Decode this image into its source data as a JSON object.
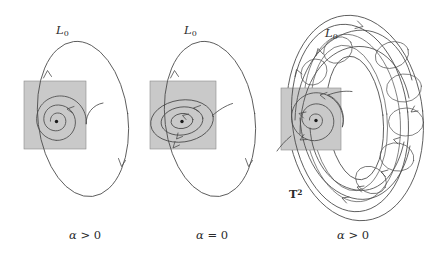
{
  "figure": {
    "background_color": "#ffffff",
    "curve_color": "#4a4a4a",
    "square_fill_color": "#c9c9c9",
    "square_stroke_color": "#8a8a8a",
    "equilibrium_color": "#1a1a1a"
  },
  "panels": [
    {
      "id": "panel-left",
      "caption": "α > 0",
      "caption_alpha": "α",
      "caption_relation": "> 0",
      "cycle_label": "L",
      "cycle_label_sub": "0",
      "description": "unstable focus with limit cycle",
      "orbit_type": "spiral-outward",
      "has_torus": false,
      "torus_label": "",
      "torus_label_sup": ""
    },
    {
      "id": "panel-middle",
      "caption": "α = 0",
      "caption_alpha": "α",
      "caption_relation": "= 0",
      "cycle_label": "L",
      "cycle_label_sub": "0",
      "description": "center with nested closed orbits",
      "orbit_type": "closed-orbits",
      "has_torus": false,
      "torus_label": "",
      "torus_label_sup": ""
    },
    {
      "id": "panel-right",
      "caption": "α > 0",
      "caption_alpha": "α",
      "caption_relation": "> 0",
      "cycle_label": "L",
      "cycle_label_sub": "0",
      "description": "invariant two-torus with quasiperiodic winding",
      "orbit_type": "torus-winding",
      "has_torus": true,
      "torus_label": "T",
      "torus_label_sup": "2"
    }
  ]
}
